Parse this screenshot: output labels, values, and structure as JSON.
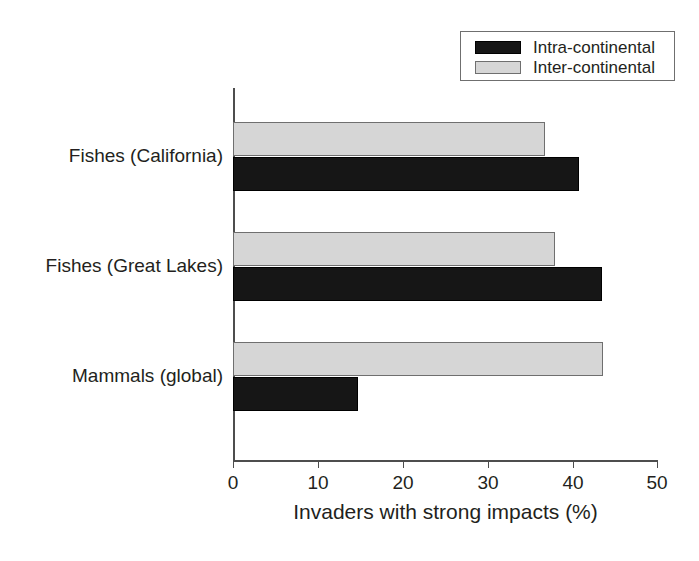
{
  "chart_data": {
    "type": "bar",
    "orientation": "horizontal",
    "title": "",
    "xlabel": "Invaders with strong impacts (%)",
    "ylabel": "",
    "xlim": [
      0,
      50
    ],
    "xticks": [
      0,
      10,
      20,
      30,
      40,
      50
    ],
    "xtick_labels": [
      "0",
      "10",
      "20",
      "30",
      "40",
      "50"
    ],
    "grid": false,
    "legend_position": "top-right",
    "categories": [
      "Fishes (California)",
      "Fishes (Great Lakes)",
      "Mammals (global)"
    ],
    "series": [
      {
        "name": "Intra-continental",
        "color": "#161616",
        "values": [
          40.7,
          43.4,
          14.7
        ]
      },
      {
        "name": "Inter-continental",
        "color": "#d6d6d6",
        "values": [
          36.7,
          37.9,
          43.5
        ]
      }
    ]
  },
  "legend": {
    "items": [
      {
        "label": "Intra-continental",
        "swatch": "intra"
      },
      {
        "label": "Inter-continental",
        "swatch": "inter"
      }
    ]
  },
  "axis": {
    "x_title": "Invaders with strong impacts (%)"
  }
}
